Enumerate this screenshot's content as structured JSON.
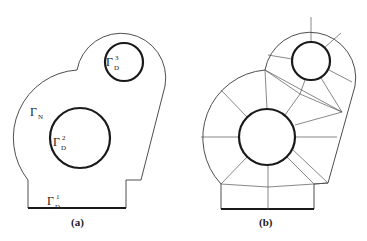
{
  "figure": {
    "panels": [
      {
        "id": "a",
        "caption": "(a)",
        "description": "Domain with two circular holes",
        "boundary_labels": [
          {
            "symbol": "Γ",
            "subscript": "N",
            "superscript": "",
            "meaning": "Neumann boundary (outer curved boundary)"
          },
          {
            "symbol": "Γ",
            "subscript": "D",
            "superscript": "1",
            "meaning": "Dirichlet boundary (bottom edge)"
          },
          {
            "symbol": "Γ",
            "subscript": "D",
            "superscript": "2",
            "meaning": "Dirichlet boundary (large hole)"
          },
          {
            "symbol": "Γ",
            "subscript": "D",
            "superscript": "3",
            "meaning": "Dirichlet boundary (small hole)"
          }
        ]
      },
      {
        "id": "b",
        "caption": "(b)",
        "description": "Coarse mesh partition of the domain"
      }
    ]
  },
  "labels": {
    "gamma": "Γ",
    "N": "N",
    "D": "D",
    "sup1": "1",
    "sup2": "2",
    "sup3": "3",
    "cap_a": "(a)",
    "cap_b": "(b)"
  }
}
